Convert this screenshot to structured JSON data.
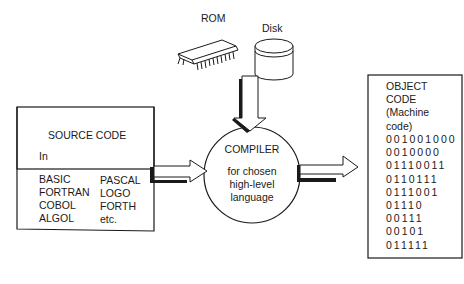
{
  "diagram": {
    "type": "compilation process",
    "storage": {
      "rom_label": "ROM",
      "disk_label": "Disk"
    },
    "source_box": {
      "title": "SOURCE CODE",
      "in_label": "In",
      "languages_left": [
        "BASIC",
        "FORTRAN",
        "COBOL",
        "ALGOL"
      ],
      "languages_right": [
        "PASCAL",
        "LOGO",
        "FORTH",
        "etc."
      ]
    },
    "compiler": {
      "title": "COMPILER",
      "subtitle_lines": [
        "for chosen",
        "high-level",
        "language"
      ]
    },
    "object_box": {
      "title_lines": [
        "OBJECT",
        "CODE",
        "(Machine",
        "code)"
      ],
      "binary_lines": [
        "001001000",
        "0010000",
        "01110011",
        "0110111",
        "0111001",
        "01110",
        "00111",
        "00101",
        "011111"
      ]
    },
    "colors": {
      "line": "#1a1a1a",
      "background": "#ffffff"
    }
  }
}
